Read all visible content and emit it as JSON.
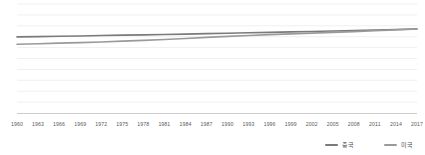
{
  "chart_data": {
    "type": "line",
    "title": "",
    "subtitle": "",
    "xlabel": "",
    "ylabel": "",
    "xlim": [
      1960,
      2017
    ],
    "ylim": [
      0,
      100
    ],
    "grid": true,
    "gridlines_y": [
      10,
      20,
      30,
      40,
      50,
      60,
      70,
      80,
      90,
      100
    ],
    "legend_position": "bottom-right",
    "x": [
      1960,
      1963,
      1966,
      1969,
      1972,
      1975,
      1978,
      1981,
      1984,
      1987,
      1990,
      1993,
      1996,
      1999,
      2002,
      2005,
      2008,
      2011,
      2014,
      2017
    ],
    "categories": [
      "1960",
      "1963",
      "1966",
      "1969",
      "1972",
      "1975",
      "1978",
      "1981",
      "1984",
      "1987",
      "1990",
      "1993",
      "1996",
      "1999",
      "2002",
      "2005",
      "2008",
      "2011",
      "2014",
      "2017"
    ],
    "series": [
      {
        "name": "중국",
        "color": "#7a7a7a",
        "values": [
          69.8,
          70.1,
          70.4,
          70.7,
          71.1,
          71.4,
          71.7,
          72.0,
          72.4,
          72.8,
          73.2,
          73.6,
          74.0,
          74.4,
          74.8,
          75.2,
          75.6,
          76.1,
          76.6,
          77.1
        ]
      },
      {
        "name": "미국",
        "color": "#9a9a9a",
        "values": [
          63.1,
          63.6,
          64.1,
          64.6,
          65.2,
          65.9,
          66.6,
          67.4,
          68.4,
          69.4,
          70.3,
          71.1,
          71.9,
          72.6,
          73.3,
          74.0,
          74.7,
          75.5,
          76.3,
          77.2
        ]
      }
    ]
  },
  "axis": {
    "tick_color": "#5a5a5a",
    "line_color": "#cccccc",
    "grid_color": "#f0f0f0"
  }
}
